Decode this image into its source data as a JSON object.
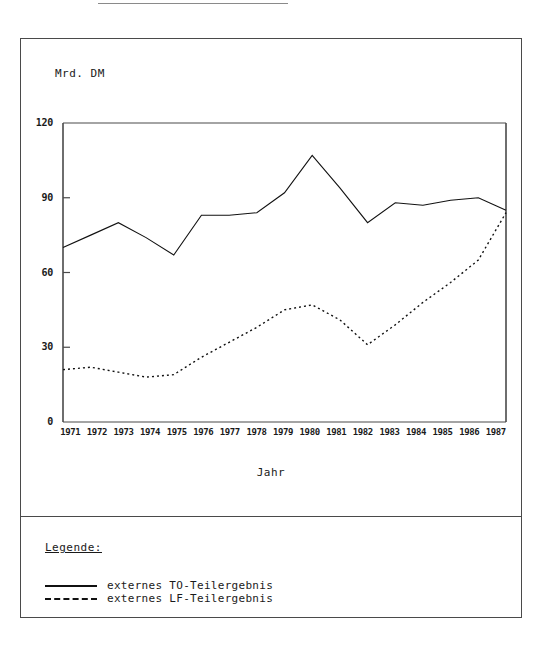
{
  "page": {
    "top_rule_present": true
  },
  "chart_data": {
    "type": "line",
    "title": "",
    "xlabel": "Jahr",
    "ylabel": "Mrd. DM",
    "unit_label": "Mrd. DM",
    "x": [
      "1971",
      "1972",
      "1973",
      "1974",
      "1975",
      "1976",
      "1977",
      "1978",
      "1979",
      "1980",
      "1981",
      "1982",
      "1983",
      "1984",
      "1985",
      "1986",
      "1987"
    ],
    "categories": [
      "1971",
      "1972",
      "1973",
      "1974",
      "1975",
      "1976",
      "1977",
      "1978",
      "1979",
      "1980",
      "1981",
      "1982",
      "1983",
      "1984",
      "1985",
      "1986",
      "1987"
    ],
    "ylim": [
      0,
      120
    ],
    "yticks": [
      0,
      30,
      60,
      90,
      120
    ],
    "ytick_labels": [
      "0",
      "30",
      "60",
      "90",
      "120"
    ],
    "grid": false,
    "legend_position": "below-plot",
    "series": [
      {
        "name": "externes TO-Teilergebnis",
        "style": "solid",
        "color": "#111111",
        "values": [
          70,
          75,
          80,
          74,
          67,
          83,
          83,
          84,
          92,
          107,
          94,
          80,
          88,
          87,
          89,
          90,
          85
        ]
      },
      {
        "name": "externes LF-Teilergebnis",
        "style": "dashed",
        "color": "#111111",
        "values": [
          21,
          22,
          20,
          18,
          19,
          26,
          32,
          38,
          45,
          47,
          41,
          31,
          39,
          48,
          56,
          65,
          84
        ]
      }
    ]
  },
  "legend": {
    "title": "Legende:",
    "entries": [
      {
        "label": "externes TO-Teilergebnis",
        "style": "solid"
      },
      {
        "label": "externes LF-Teilergebnis",
        "style": "dashed"
      }
    ]
  }
}
